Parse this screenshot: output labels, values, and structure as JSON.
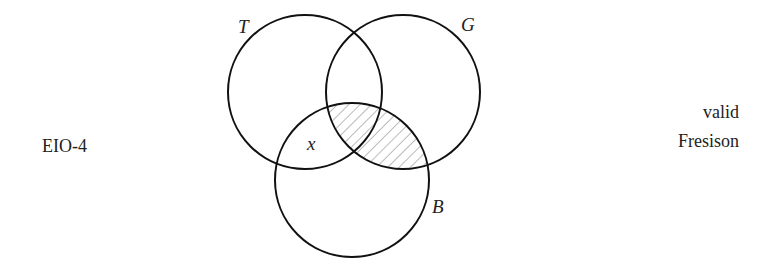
{
  "diagram": {
    "type": "venn",
    "form_label": "EIO-4",
    "verdict": {
      "line1": "valid",
      "line2": "Fresison"
    },
    "circles": [
      {
        "name": "T",
        "cx": 305,
        "cy": 92,
        "r": 77
      },
      {
        "name": "G",
        "cx": 403,
        "cy": 92,
        "r": 77
      },
      {
        "name": "B",
        "cx": 352,
        "cy": 180,
        "r": 77
      }
    ],
    "circle_labels": {
      "T": "T",
      "G": "G",
      "B": "B"
    },
    "existence_mark": "x",
    "shaded_region": "B∩G",
    "colors": {
      "stroke": "#111111",
      "hatch": "#777777",
      "text": "#222222"
    }
  }
}
